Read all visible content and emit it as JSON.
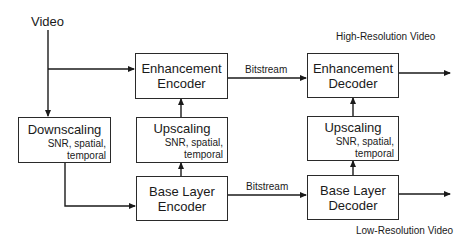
{
  "input": {
    "label": "Video"
  },
  "boxes": {
    "downscaling": {
      "title": "Downscaling",
      "sub1": "SNR, spatial,",
      "sub2": "temporal"
    },
    "enh_encoder": {
      "line1": "Enhancement",
      "line2": "Encoder"
    },
    "upscaling_enc": {
      "title": "Upscaling",
      "sub1": "SNR, spatial,",
      "sub2": "temporal"
    },
    "base_encoder": {
      "line1": "Base Layer",
      "line2": "Encoder"
    },
    "enh_decoder": {
      "line1": "Enhancement",
      "line2": "Decoder"
    },
    "upscaling_dec": {
      "title": "Upscaling",
      "sub1": "SNR, spatial,",
      "sub2": "temporal"
    },
    "base_decoder": {
      "line1": "Base Layer",
      "line2": "Decoder"
    }
  },
  "edges": {
    "bitstream_top": "Bitstream",
    "bitstream_bottom": "Bitstream"
  },
  "outputs": {
    "high": "High-Resolution Video",
    "low": "Low-Resolution Video"
  }
}
